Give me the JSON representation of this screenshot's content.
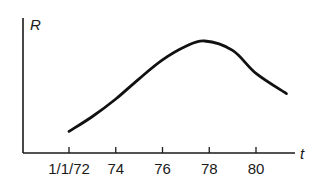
{
  "chart_data": {
    "type": "line",
    "title": "",
    "xlabel": "t",
    "ylabel": "R",
    "x_tick_labels": [
      "1/1/72",
      "74",
      "76",
      "78",
      "80"
    ],
    "x_ticks": [
      72,
      74,
      76,
      78,
      80
    ],
    "xlim": [
      70.0,
      82.0
    ],
    "ylim": [
      0,
      1
    ],
    "y_ticks": [],
    "grid": false,
    "legend": null,
    "series": [
      {
        "name": "R(t)",
        "x": [
          72,
          73,
          74,
          75,
          76,
          77,
          77.8,
          79,
          80,
          81.3
        ],
        "values": [
          0.16,
          0.27,
          0.4,
          0.55,
          0.69,
          0.79,
          0.83,
          0.76,
          0.59,
          0.44
        ]
      }
    ]
  },
  "axes": {
    "y_title": "R",
    "x_title": "t"
  }
}
